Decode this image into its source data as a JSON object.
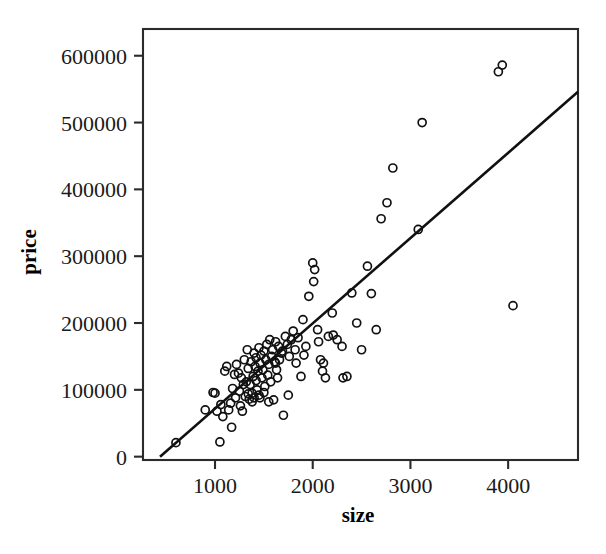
{
  "chart_data": {
    "type": "scatter",
    "title": "",
    "xlabel": "size",
    "ylabel": "price",
    "grid": false,
    "legend": null,
    "xlim": [
      263,
      4715
    ],
    "ylim": [
      -5000,
      640000
    ],
    "xticks": [
      1000,
      2000,
      3000,
      4000
    ],
    "xtick_labels": [
      "1000",
      "2000",
      "3000",
      "4000"
    ],
    "yticks": [
      0,
      100000,
      200000,
      300000,
      400000,
      500000,
      600000
    ],
    "ytick_labels": [
      "0",
      "100000",
      "200000",
      "300000",
      "400000",
      "500000",
      "600000"
    ],
    "marker": "open-circle",
    "series": [
      {
        "name": "houses",
        "x": [
          600,
          1050,
          1170,
          900,
          1000,
          1080,
          1100,
          1160,
          1200,
          1220,
          1250,
          1270,
          1280,
          1300,
          1310,
          1320,
          1330,
          1340,
          1350,
          1360,
          1370,
          1380,
          1390,
          1400,
          1400,
          1410,
          1420,
          1430,
          1440,
          1450,
          1450,
          1460,
          1470,
          1480,
          1490,
          1500,
          1510,
          1520,
          1530,
          1540,
          1550,
          1560,
          1570,
          1580,
          1590,
          1600,
          1610,
          1620,
          1630,
          1640,
          1650,
          1660,
          1680,
          1700,
          1720,
          1740,
          1760,
          1780,
          1800,
          1820,
          1850,
          1880,
          1900,
          1930,
          1960,
          2000,
          2020,
          2050,
          2080,
          2100,
          2130,
          2160,
          2200,
          2250,
          2300,
          2350,
          2400,
          2450,
          2500,
          2560,
          2600,
          2650,
          2700,
          2760,
          2820,
          3080,
          3120,
          3900,
          3940,
          4050,
          980,
          1020,
          1060,
          1120,
          1140,
          1180,
          1210,
          1240,
          1260,
          1290,
          1340,
          1380,
          1420,
          1460,
          1500,
          1550,
          1620,
          1690,
          1750,
          1830,
          1910,
          2010,
          2060,
          2110,
          2210,
          2310
        ],
        "y": [
          21000,
          22000,
          44000,
          70000,
          95000,
          60000,
          128000,
          80000,
          123000,
          138000,
          98000,
          118000,
          68000,
          145000,
          90000,
          112000,
          160000,
          132000,
          86000,
          108000,
          142000,
          95000,
          120000,
          155000,
          88000,
          135000,
          148000,
          100000,
          128000,
          163000,
          92000,
          140000,
          152000,
          118000,
          130000,
          158000,
          105000,
          145000,
          168000,
          122000,
          138000,
          175000,
          112000,
          150000,
          160000,
          85000,
          142000,
          172000,
          130000,
          118000,
          165000,
          145000,
          155000,
          62000,
          180000,
          168000,
          150000,
          175000,
          188000,
          160000,
          178000,
          120000,
          205000,
          165000,
          240000,
          290000,
          280000,
          190000,
          145000,
          128000,
          118000,
          180000,
          215000,
          175000,
          165000,
          120000,
          245000,
          200000,
          160000,
          285000,
          244000,
          190000,
          356000,
          380000,
          432000,
          340000,
          500000,
          576000,
          586000,
          226000,
          96000,
          68000,
          78000,
          135000,
          70000,
          102000,
          88000,
          125000,
          76000,
          108000,
          94000,
          82000,
          114000,
          88000,
          96000,
          82000,
          140000,
          158000,
          92000,
          140000,
          152000,
          262000,
          172000,
          140000,
          182000,
          118000
        ]
      }
    ],
    "fit_line": {
      "name": "least-squares fit",
      "x0": 437,
      "y0": 0,
      "x1": 4715,
      "y1": 546000
    }
  },
  "figure": {
    "background_color": "#ffffff",
    "marker_color": "#111111",
    "line_color": "#111111",
    "frame_color": "#2b2b2b"
  }
}
